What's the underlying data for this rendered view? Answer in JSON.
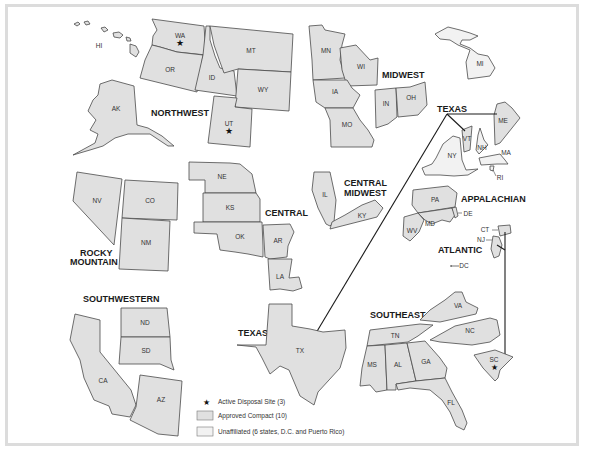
{
  "map": {
    "title": "",
    "regions": [
      {
        "name": "NORTHWEST",
        "states": [
          "WA",
          "OR",
          "ID",
          "MT",
          "WY",
          "UT",
          "AK",
          "HI"
        ]
      },
      {
        "name": "MIDWEST",
        "states": [
          "MN",
          "WI",
          "IA",
          "MO",
          "IN",
          "OH"
        ]
      },
      {
        "name": "ROCKY MOUNTAIN",
        "lines": [
          "ROCKY",
          "MOUNTAIN"
        ],
        "states": [
          "NV",
          "CO",
          "NM"
        ]
      },
      {
        "name": "CENTRAL",
        "states": [
          "NE",
          "KS",
          "OK",
          "AR",
          "LA"
        ]
      },
      {
        "name": "CENTRAL MIDWEST",
        "lines": [
          "CENTRAL",
          "MIDWEST"
        ],
        "states": [
          "IL",
          "KY"
        ]
      },
      {
        "name": "APPALACHIAN",
        "states": [
          "PA",
          "WV",
          "MD",
          "DE"
        ]
      },
      {
        "name": "ATLANTIC",
        "states": [
          "CT",
          "NJ",
          "SC"
        ]
      },
      {
        "name": "SOUTHWESTERN",
        "states": [
          "CA",
          "AZ",
          "ND",
          "SD"
        ]
      },
      {
        "name": "TEXAS",
        "states": [
          "TX",
          "VT",
          "ME"
        ]
      },
      {
        "name": "SOUTHEAST",
        "states": [
          "VA",
          "NC",
          "TN",
          "MS",
          "AL",
          "GA",
          "FL"
        ]
      }
    ],
    "unaffiliated_states": [
      "MI",
      "NY",
      "NH",
      "MA",
      "RI",
      "DC"
    ],
    "disposal_sites": [
      "WA",
      "UT",
      "SC"
    ],
    "state_labels": {
      "HI": "HI",
      "WA": "WA",
      "OR": "OR",
      "ID": "ID",
      "MT": "MT",
      "WY": "WY",
      "UT": "UT",
      "AK": "AK",
      "MN": "MN",
      "WI": "WI",
      "IA": "IA",
      "MO": "MO",
      "IN": "IN",
      "OH": "OH",
      "MI": "MI",
      "NY": "NY",
      "VT": "VT",
      "NH": "NH",
      "ME": "ME",
      "MA": "MA",
      "RI": "RI",
      "NE": "NE",
      "KS": "KS",
      "OK": "OK",
      "AR": "AR",
      "LA": "LA",
      "IL": "IL",
      "KY": "KY",
      "PA": "PA",
      "WV": "WV",
      "MD": "MD",
      "DE": "DE",
      "CT": "CT",
      "NJ": "NJ",
      "DC": "DC",
      "NV": "NV",
      "CO": "CO",
      "NM": "NM",
      "ND": "ND",
      "SD": "SD",
      "CA": "CA",
      "AZ": "AZ",
      "TX": "TX",
      "VA": "VA",
      "NC": "NC",
      "TN": "TN",
      "MS": "MS",
      "AL": "AL",
      "GA": "GA",
      "FL": "FL",
      "SC": "SC"
    },
    "region_labels": {
      "northwest": "NORTHWEST",
      "midwest": "MIDWEST",
      "texas_top": "TEXAS",
      "texas_bottom": "TEXAS",
      "central": "CENTRAL",
      "central_midwest_1": "CENTRAL",
      "central_midwest_2": "MIDWEST",
      "appalachian": "APPALACHIAN",
      "atlantic": "ATLANTIC",
      "rocky_1": "ROCKY",
      "rocky_2": "MOUNTAIN",
      "southwestern": "SOUTHWESTERN",
      "southeast": "SOUTHEAST"
    },
    "colors": {
      "compact_fill": "#e0e0e0",
      "unaffiliated_fill": "#f2f2f2",
      "stroke": "#4a4a4a",
      "frame": "#dcdcdc"
    }
  },
  "legend": {
    "items": [
      {
        "icon": "star-icon",
        "label": "Active Disposal Site (3)"
      },
      {
        "icon": "swatch-compact",
        "label": "Approved Compact (10)"
      },
      {
        "icon": "swatch-unaffiliated",
        "label": "Unaffiliated (6 states, D.C. and Puerto Rico)"
      }
    ]
  }
}
